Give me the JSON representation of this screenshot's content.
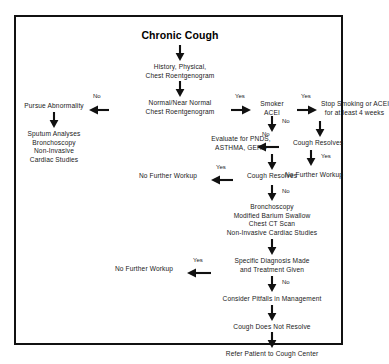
{
  "diagram": {
    "title": "Chronic Cough",
    "type": "clinical-algorithm-flowchart",
    "nodes": [
      {
        "id": "chronic-cough",
        "label": "Chronic Cough"
      },
      {
        "id": "history-physical",
        "line1": "History, Physical,",
        "line2": "Chest Roentgenogram"
      },
      {
        "id": "normal-roentgenogram",
        "line1": "Normal/Near Normal",
        "line2": "Chest Roentgenogram"
      },
      {
        "id": "pursue-abnormality",
        "label": "Pursue Abnormality"
      },
      {
        "id": "sputum-studies",
        "line1": "Sputum Analyses",
        "line2": "Bronchoscopy",
        "line3": "Non-Invasive",
        "line4": "Cardiac Studies"
      },
      {
        "id": "smoker-acei",
        "line1": "Smoker",
        "line2": "ACEI"
      },
      {
        "id": "stop-smoking",
        "line1": "Stop Smoking or ACEI",
        "line2": "for at least 4 weeks"
      },
      {
        "id": "cough-resolves-right",
        "label": "Cough Resolves"
      },
      {
        "id": "no-further-workup-right",
        "label": "No Further Workup"
      },
      {
        "id": "evaluate-pnds",
        "line1": "Evaluate for PNDS,",
        "line2": "ASTHMA, GERD"
      },
      {
        "id": "cough-resolves-mid",
        "label": "Cough Resolves"
      },
      {
        "id": "no-further-workup-mid",
        "label": "No Further Workup"
      },
      {
        "id": "bronchoscopy-workup",
        "line1": "Bronchoscopy",
        "line2": "Modified Barium Swallow",
        "line3": "Chest CT Scan",
        "line4": "Non-Invasive Cardiac Studies"
      },
      {
        "id": "specific-diagnosis",
        "line1": "Specific Diagnosis Made",
        "line2": "and Treatment Given"
      },
      {
        "id": "no-further-workup-lower",
        "label": "No Further Workup"
      },
      {
        "id": "consider-pitfalls",
        "label": "Consider Pitfalls in Management"
      },
      {
        "id": "cough-does-not-resolve",
        "label": "Cough Does Not Resolve"
      },
      {
        "id": "refer-cough-center",
        "label": "Refer Patient to Cough Center"
      }
    ],
    "edge_labels": {
      "roentgenogram_no": "No",
      "roentgenogram_yes": "Yes",
      "smoker_yes": "Yes",
      "smoker_no": "No",
      "cough_resolves_right_no": "No",
      "cough_resolves_right_yes": "Yes",
      "cough_resolves_mid_yes": "Yes",
      "cough_resolves_mid_no": "No",
      "specific_diagnosis_yes": "Yes",
      "specific_diagnosis_no": "No"
    },
    "colors": {
      "ink": "#111111",
      "text": "#1a1a1a",
      "background": "#ffffff"
    }
  }
}
